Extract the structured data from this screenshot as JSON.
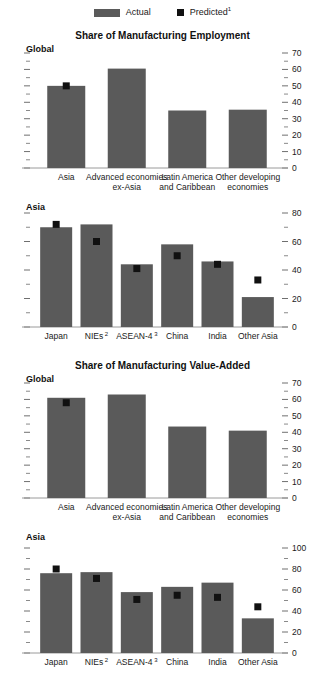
{
  "page": {
    "faint_header": "",
    "background": "#ffffff",
    "bar_color": "#5a5a5a",
    "marker_color": "#111111",
    "axis_color": "#9a9a9a"
  },
  "legend": {
    "items": [
      {
        "label": "Actual",
        "type": "bar-swatch",
        "color": "#5a5a5a",
        "footnote": ""
      },
      {
        "label": "Predicted",
        "type": "square-marker",
        "color": "#111111",
        "footnote": "1"
      }
    ]
  },
  "titles": {
    "employment": "Share of Manufacturing Employment",
    "value_added": "Share of Manufacturing Value-Added"
  },
  "panel_labels": {
    "global": "Global",
    "asia": "Asia"
  },
  "chart_data": [
    {
      "id": "global-employment",
      "type": "bar",
      "title": "Share of Manufacturing Employment",
      "panel": "Global",
      "xlabel": "",
      "ylabel": "",
      "ylim": [
        0,
        70
      ],
      "yticks": [
        0,
        10,
        20,
        30,
        40,
        50,
        60,
        70
      ],
      "ticklabels": [
        "0",
        "10",
        "20",
        "30",
        "40",
        "50",
        "60",
        "70"
      ],
      "axis_position": "right",
      "grid": false,
      "categories": [
        "Asia",
        "Advanced economies ex-Asia",
        "Latin America and Caribbean",
        "Other developing economies"
      ],
      "category_lines": [
        [
          "Asia"
        ],
        [
          "Advanced economies",
          "ex-Asia"
        ],
        [
          "Latin America",
          "and Caribbean"
        ],
        [
          "Other developing",
          "economies"
        ]
      ],
      "series": [
        {
          "name": "Actual",
          "values": [
            50.0,
            60.5,
            35.0,
            35.5
          ]
        },
        {
          "name": "Predicted",
          "values": [
            50.0,
            null,
            null,
            null
          ]
        }
      ]
    },
    {
      "id": "asia-employment",
      "type": "bar",
      "title": "Share of Manufacturing Employment",
      "panel": "Asia",
      "xlabel": "",
      "ylabel": "",
      "ylim": [
        0,
        80
      ],
      "yticks": [
        0,
        20,
        40,
        60,
        80
      ],
      "ticklabels": [
        "0",
        "20",
        "40",
        "60",
        "80"
      ],
      "axis_position": "right",
      "grid": false,
      "categories": [
        "Japan",
        "NIEs",
        "ASEAN-4",
        "China",
        "India",
        "Other Asia"
      ],
      "category_footnotes": [
        "",
        "2",
        "3",
        "",
        "",
        ""
      ],
      "category_lines": [
        [
          "Japan"
        ],
        [
          "NIEs"
        ],
        [
          "ASEAN-4"
        ],
        [
          "China"
        ],
        [
          "India"
        ],
        [
          "Other Asia"
        ]
      ],
      "series": [
        {
          "name": "Actual",
          "values": [
            70.0,
            72.0,
            44.0,
            58.0,
            46.0,
            21.0
          ]
        },
        {
          "name": "Predicted",
          "values": [
            72.0,
            60.0,
            41.0,
            50.0,
            44.0,
            33.0
          ]
        }
      ]
    },
    {
      "id": "global-value-added",
      "type": "bar",
      "title": "Share of Manufacturing Value-Added",
      "panel": "Global",
      "xlabel": "",
      "ylabel": "",
      "ylim": [
        0,
        70
      ],
      "yticks": [
        0,
        10,
        20,
        30,
        40,
        50,
        60,
        70
      ],
      "ticklabels": [
        "0",
        "10",
        "20",
        "30",
        "40",
        "50",
        "60",
        "70"
      ],
      "axis_position": "right",
      "grid": false,
      "categories": [
        "Asia",
        "Advanced economies ex-Asia",
        "Latin America and Caribbean",
        "Other developing economies"
      ],
      "category_lines": [
        [
          "Asia"
        ],
        [
          "Advanced economies",
          "ex-Asia"
        ],
        [
          "Latin America",
          "and Caribbean"
        ],
        [
          "Other developing",
          "economies"
        ]
      ],
      "series": [
        {
          "name": "Actual",
          "values": [
            61.0,
            63.0,
            43.5,
            41.0
          ]
        },
        {
          "name": "Predicted",
          "values": [
            58.0,
            null,
            null,
            null
          ]
        }
      ]
    },
    {
      "id": "asia-value-added",
      "type": "bar",
      "title": "Share of Manufacturing Value-Added",
      "panel": "Asia",
      "xlabel": "",
      "ylabel": "",
      "ylim": [
        0,
        100
      ],
      "yticks": [
        0,
        20,
        40,
        60,
        80,
        100
      ],
      "ticklabels": [
        "0",
        "20",
        "40",
        "60",
        "80",
        "100"
      ],
      "axis_position": "right",
      "grid": false,
      "categories": [
        "Japan",
        "NIEs",
        "ASEAN-4",
        "China",
        "India",
        "Other Asia"
      ],
      "category_footnotes": [
        "",
        "2",
        "3",
        "",
        "",
        ""
      ],
      "category_lines": [
        [
          "Japan"
        ],
        [
          "NIEs"
        ],
        [
          "ASEAN-4"
        ],
        [
          "China"
        ],
        [
          "India"
        ],
        [
          "Other Asia"
        ]
      ],
      "series": [
        {
          "name": "Actual",
          "values": [
            76.0,
            77.0,
            58.0,
            63.0,
            67.0,
            33.0
          ]
        },
        {
          "name": "Predicted",
          "values": [
            80.0,
            71.0,
            51.0,
            55.0,
            53.0,
            44.0
          ]
        }
      ]
    }
  ]
}
